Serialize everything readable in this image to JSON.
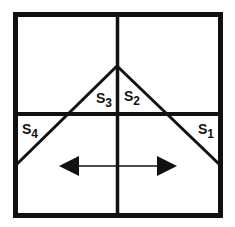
{
  "diagram": {
    "type": "window-grid-with-diagonals",
    "colors": {
      "line": "#111111",
      "background": "#ffffff"
    },
    "labels": [
      {
        "id": "s1",
        "main": "S",
        "sub": "1"
      },
      {
        "id": "s2",
        "main": "S",
        "sub": "2"
      },
      {
        "id": "s3",
        "main": "S",
        "sub": "3"
      },
      {
        "id": "s4",
        "main": "S",
        "sub": "4"
      }
    ],
    "arrow": {
      "direction": "bidirectional-horizontal"
    }
  }
}
